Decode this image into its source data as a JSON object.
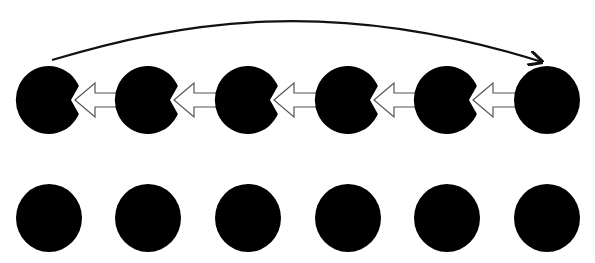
{
  "diagram": {
    "colors": {
      "node_fill": "#000000",
      "arrow_fill": "#ffffff",
      "arrow_stroke": "#555555",
      "curve_stroke": "#111111",
      "background": "#ffffff"
    },
    "rows": [
      {
        "name": "top-row",
        "node_count": 6
      },
      {
        "name": "bottom-row",
        "node_count": 6
      }
    ],
    "block_arrows": [
      {
        "from": 2,
        "to": 1,
        "direction": "left"
      },
      {
        "from": 3,
        "to": 2,
        "direction": "left"
      },
      {
        "from": 4,
        "to": 3,
        "direction": "left"
      },
      {
        "from": 5,
        "to": 4,
        "direction": "left"
      },
      {
        "from": 6,
        "to": 5,
        "direction": "left"
      }
    ],
    "curved_arrow": {
      "from": 1,
      "to": 6,
      "row": "top-row",
      "arrowhead": "end"
    }
  }
}
